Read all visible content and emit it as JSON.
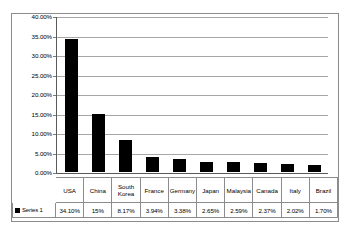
{
  "chart_data": {
    "type": "bar",
    "title": "",
    "subtitle": "",
    "xlabel": "",
    "ylabel": "",
    "legend_position": "data-table-row-header",
    "grid": "horizontal",
    "ylim": [
      0,
      0.4
    ],
    "ytick_labels": [
      "40.00%",
      "35.00%",
      "30.00%",
      "25.00%",
      "20.00%",
      "15.00%",
      "10.00%",
      "5.00%",
      "0.00%"
    ],
    "ytick_values": [
      0.4,
      0.35,
      0.3,
      0.25,
      0.2,
      0.15,
      0.1,
      0.05,
      0.0
    ],
    "categories": [
      "USA",
      "China",
      "South Korea",
      "France",
      "Germany",
      "Japan",
      "Malaysia",
      "Canada",
      "Italy",
      "Brazil"
    ],
    "category_labels": [
      "USA",
      "China",
      "South\nKorea",
      "France",
      "Germany",
      "Japan",
      "Malaysia",
      "Canada",
      "Italy",
      "Brazil"
    ],
    "series": [
      {
        "name": "Series 1",
        "color": "#000000",
        "values": [
          0.341,
          0.15,
          0.0817,
          0.0394,
          0.0338,
          0.0265,
          0.0259,
          0.0237,
          0.0202,
          0.017
        ],
        "value_labels": [
          "34.10%",
          "15%",
          "8.17%",
          "3.94%",
          "3.38%",
          "2.65%",
          "2.59%",
          "2.37%",
          "2.02%",
          "1.70%"
        ]
      }
    ]
  },
  "legend": {
    "series_name": "Series 1",
    "swatch_color": "#000000"
  }
}
